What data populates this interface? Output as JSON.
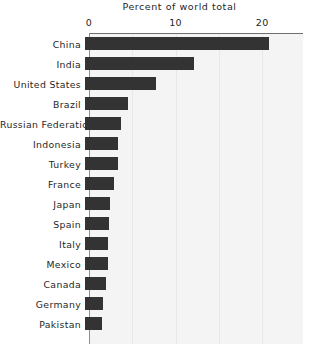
{
  "chart_data": {
    "type": "bar",
    "orientation": "horizontal",
    "title": "Percent of world total",
    "xlabel": "",
    "ylabel": "",
    "xlim": [
      0,
      24.7
    ],
    "xticks": [
      0,
      10,
      20
    ],
    "xtick_labels": [
      "0",
      "10",
      "20"
    ],
    "grid": true,
    "grid_axis": "x",
    "legend": false,
    "bar_color": "#333333",
    "plot_background": "#f4f4f4",
    "axis_color": "#6e6e6e",
    "categories": [
      "China",
      "India",
      "United States",
      "Brazil",
      "Russian Federation",
      "Indonesia",
      "Turkey",
      "France",
      "Japan",
      "Spain",
      "Italy",
      "Mexico",
      "Canada",
      "Germany",
      "Pakistan"
    ],
    "values": [
      21.2,
      12.6,
      8.2,
      5.0,
      4.1,
      3.8,
      3.8,
      3.4,
      2.9,
      2.8,
      2.7,
      2.6,
      2.4,
      2.1,
      2.0
    ]
  }
}
